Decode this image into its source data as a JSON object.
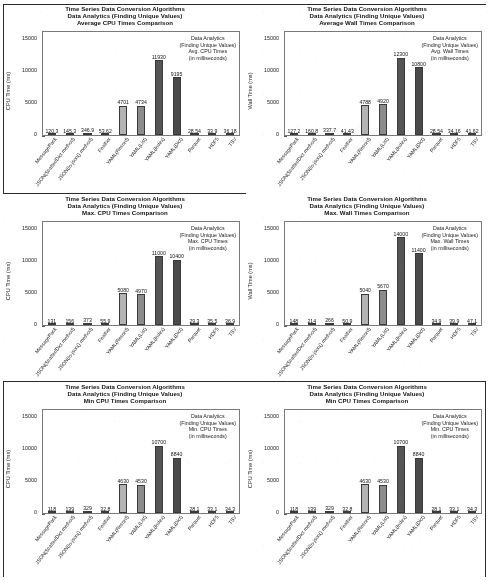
{
  "document": {
    "kind": "scanned-figure-page",
    "chart_count": 6
  },
  "axis": {
    "y_ticks": [
      "0",
      "5000",
      "10000",
      "15000"
    ],
    "y_values": [
      0,
      5000,
      10000,
      15000
    ],
    "ylim": [
      0,
      16000
    ],
    "ylabel_cpu": "CPU Time (ms)",
    "ylabel_wall": "Wall Time (ms)"
  },
  "categories": [
    "MessagePack",
    "JSON(Scatter/Dict method)",
    "JSON(to-json() method)",
    "Feather",
    "YAML(Record)",
    "YAML(List)",
    "YAML(Index)",
    "YAML(Dict)",
    "Parquet",
    "HDF5",
    "TSV"
  ],
  "colors": {
    "bar_light": "#b3b3b3",
    "bar_mid": "#8c8c8c",
    "bar_dark": "#555555",
    "bar_dark2": "#4a4a4a",
    "axis": "#7a7a7a",
    "ink": "#1a1a1a",
    "frame": "#2b2b2b",
    "paper": "#ffffff"
  },
  "chart_data": [
    {
      "id": "avg-cpu",
      "type": "bar",
      "title_lines": [
        "Time Series Data Conversion Algorithms",
        "Data Analytics (Finding Unique Values)",
        "Average CPU Times Comparison"
      ],
      "annotation_lines": [
        "Data Analytics",
        "(Finding Unique Values)",
        "Avg. CPU Times",
        "(in milliseconds)"
      ],
      "ylabel": "CPU Time (ms)",
      "xlabel": "",
      "ylim": [
        0,
        16000
      ],
      "grid": false,
      "legend": "none",
      "categories": [
        "MessagePack",
        "JSON(Scatter/Dict method)",
        "JSON(to-json() method)",
        "Feather",
        "YAML(Record)",
        "YAML(List)",
        "YAML(Index)",
        "YAML(Dict)",
        "Parquet",
        "HDF5",
        "TSV"
      ],
      "values": [
        120.3,
        145.3,
        346.9,
        53.62,
        4701,
        4734,
        11930,
        9195,
        28.54,
        33.9,
        36.18
      ],
      "labels": [
        "120.3",
        "145.3",
        "346.9",
        "53.62",
        "4701",
        "4734",
        "11930",
        "9195",
        "28.54",
        "33.9",
        "36.18"
      ]
    },
    {
      "id": "avg-wall",
      "type": "bar",
      "title_lines": [
        "Time Series Data Conversion Algorithms",
        "Data Analytics (Finding Unique Values)",
        "Average Wall Times Comparison"
      ],
      "annotation_lines": [
        "Data Analytics",
        "(Finding Unique Values)",
        "Avg. Wall Times",
        "(in milliseconds)"
      ],
      "ylabel": "Wall Time (ms)",
      "xlabel": "",
      "ylim": [
        0,
        16000
      ],
      "grid": false,
      "legend": "none",
      "categories": [
        "MessagePack",
        "JSON(Scatter/Dict method)",
        "JSON(to-json() method)",
        "Feather",
        "YAML(Record)",
        "YAML(List)",
        "YAML(Index)",
        "YAML(Dict)",
        "Parquet",
        "HDF5",
        "TSV"
      ],
      "values": [
        127.2,
        160.8,
        337.7,
        41.43,
        4788,
        4920,
        12300,
        10800,
        28.54,
        34.16,
        41.62
      ],
      "labels": [
        "127.2",
        "160.8",
        "337.7",
        "41.43",
        "4788",
        "4920",
        "12300",
        "10800",
        "28.54",
        "34.16",
        "41.62"
      ]
    },
    {
      "id": "max-cpu",
      "type": "bar",
      "title_lines": [
        "Time Series Data Conversion Algorithms",
        "Data Analytics (Finding Unique Values)",
        "Max. CPU Times Comparison"
      ],
      "annotation_lines": [
        "Data Analytics",
        "(Finding Unique Values)",
        "Max. CPU Times",
        "(in milliseconds)"
      ],
      "ylabel": "CPU Time (ms)",
      "xlabel": "",
      "ylim": [
        0,
        16000
      ],
      "grid": false,
      "legend": "none",
      "categories": [
        "MessagePack",
        "JSON(Scatter/Dict method)",
        "JSON(to-json() method)",
        "Feather",
        "YAML(Record)",
        "YAML(List)",
        "YAML(Index)",
        "YAML(Dict)",
        "Parquet",
        "HDF5",
        "TSV"
      ],
      "values": [
        131,
        156,
        373,
        55.9,
        5080,
        4970,
        11000,
        10400,
        29.3,
        35.5,
        36.9
      ],
      "labels": [
        "131",
        "156",
        "373",
        "55.9",
        "5080",
        "4970",
        "11000",
        "10400",
        "29.3",
        "35.5",
        "36.9"
      ]
    },
    {
      "id": "max-wall",
      "type": "bar",
      "title_lines": [
        "Time Series Data Conversion Algorithms",
        "Data Analytics (Finding Unique Values)",
        "Max. Wall Times Comparison"
      ],
      "annotation_lines": [
        "Data Analytics",
        "(Finding Unique Values)",
        "Max. Wall Times",
        "(in milliseconds)"
      ],
      "ylabel": "Wall Time (ms)",
      "xlabel": "",
      "ylim": [
        0,
        16000
      ],
      "grid": false,
      "legend": "none",
      "categories": [
        "MessagePack",
        "JSON(Scatter/Dict method)",
        "JSON(to-json() method)",
        "Feather",
        "YAML(Record)",
        "YAML(List)",
        "YAML(Index)",
        "YAML(Dict)",
        "Parquet",
        "HDF5",
        "TSV"
      ],
      "values": [
        148,
        214,
        266,
        50.9,
        5040,
        5670,
        14000,
        11400,
        34.9,
        39.9,
        47.1
      ],
      "labels": [
        "148",
        "214",
        "266",
        "50.9",
        "5040",
        "5670",
        "14000",
        "11400",
        "34.9",
        "39.9",
        "47.1"
      ]
    },
    {
      "id": "min-cpu-left",
      "type": "bar",
      "title_lines": [
        "Time Series Data Conversion Algorithms",
        "Data Analytics (Finding Unique Values)",
        "Min CPU Times Comparison"
      ],
      "annotation_lines": [
        "Data Analytics",
        "(Finding Unique Values)",
        "Min. CPU Times",
        "(in milliseconds)"
      ],
      "ylabel": "CPU Time (ms)",
      "xlabel": "",
      "ylim": [
        0,
        16000
      ],
      "grid": false,
      "legend": "none",
      "categories": [
        "MessagePack",
        "JSON(Scatter/Dict method)",
        "JSON(to-json() method)",
        "Feather",
        "YAML(Record)",
        "YAML(List)",
        "YAML(Index)",
        "YAML(Dict)",
        "Parquet",
        "HDF5",
        "TSV"
      ],
      "values": [
        118,
        139,
        329,
        32.8,
        4630,
        4530,
        10700,
        8840,
        28.1,
        33.1,
        34.3
      ],
      "labels": [
        "118",
        "139",
        "329",
        "32.8",
        "4630",
        "4530",
        "10700",
        "8840",
        "28.1",
        "33.1",
        "34.3"
      ]
    },
    {
      "id": "min-cpu-right",
      "type": "bar",
      "title_lines": [
        "Time Series Data Conversion Algorithms",
        "Data Analytics (Finding Unique Values)",
        "Min CPU Times Comparison"
      ],
      "annotation_lines": [
        "Data Analytics",
        "(Finding Unique Values)",
        "Min. CPU Times",
        "(in milliseconds)"
      ],
      "ylabel": "CPU Time (ms)",
      "xlabel": "",
      "ylim": [
        0,
        16000
      ],
      "grid": false,
      "legend": "none",
      "categories": [
        "MessagePack",
        "JSON(Scatter/Dict method)",
        "JSON(to-json() method)",
        "Feather",
        "YAML(Record)",
        "YAML(List)",
        "YAML(Index)",
        "YAML(Dict)",
        "Parquet",
        "HDF5",
        "TSV"
      ],
      "values": [
        118,
        139,
        329,
        32.8,
        4630,
        4530,
        10700,
        8840,
        28.1,
        33.1,
        34.3
      ],
      "labels": [
        "118",
        "139",
        "329",
        "32.8",
        "4630",
        "4530",
        "10700",
        "8840",
        "28.1",
        "33.1",
        "34.3"
      ]
    }
  ]
}
